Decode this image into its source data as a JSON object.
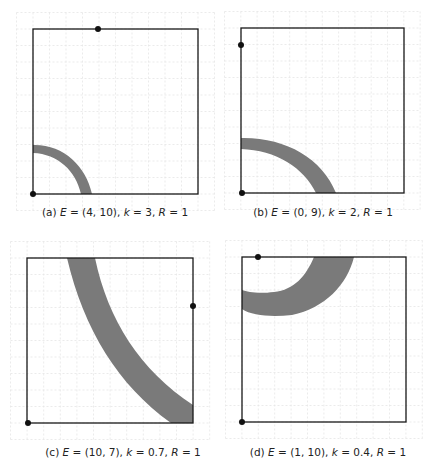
{
  "figure": {
    "colors": {
      "band": "#7a7a7a",
      "frame": "#1a1a1a",
      "grid": "#e6e6e6",
      "dot": "#111111"
    },
    "grid_unit_px": 16.5,
    "panels": [
      {
        "id": "a",
        "label": "(a)",
        "E": "(4, 10)",
        "k": "3",
        "R": "1",
        "caption": "(a) E = (4, 10), k = 3, R = 1",
        "frame": {
          "x": 33,
          "y": 29,
          "w": 165,
          "h": 165
        },
        "dots": [
          {
            "x": 98,
            "y": 29
          },
          {
            "x": 33,
            "y": 194
          }
        ],
        "band_path": "M33,145 C63,144 86,166 92,194 L81,194 C76,171 58,154 33,153 Z",
        "caption_pos": {
          "x": 115,
          "y": 206
        }
      },
      {
        "id": "b",
        "label": "(b)",
        "E": "(0, 9)",
        "k": "2",
        "R": "1",
        "caption": "(b) E = (0, 9), k = 2, R = 1",
        "frame": {
          "x": 241,
          "y": 28,
          "w": 163,
          "h": 165
        },
        "dots": [
          {
            "x": 241,
            "y": 45
          },
          {
            "x": 242,
            "y": 193
          }
        ],
        "band_path": "M241,138 C285,137 322,158 336,193 L316,193 C304,168 276,150 241,149 Z",
        "caption_pos": {
          "x": 323,
          "y": 206
        }
      },
      {
        "id": "c",
        "label": "(c)",
        "E": "(10, 7)",
        "k": "0.7",
        "R": "1",
        "caption": "(c) E = (10, 7), k = 0.7, R = 1",
        "frame": {
          "x": 27,
          "y": 258,
          "w": 166,
          "h": 165
        },
        "dots": [
          {
            "x": 193,
            "y": 306
          },
          {
            "x": 28,
            "y": 423
          }
        ],
        "band_path": "M67,258 L95,258 C108,320 140,370 193,405 L193,423 L171,423 C118,385 84,330 67,258 Z",
        "caption_pos": {
          "x": 123,
          "y": 446
        }
      },
      {
        "id": "d",
        "label": "(d)",
        "E": "(1, 10)",
        "k": "0.4",
        "R": "1",
        "caption": "(d) E = (1, 10), k = 0.4, R = 1",
        "frame": {
          "x": 242,
          "y": 257,
          "w": 164,
          "h": 165
        },
        "dots": [
          {
            "x": 258,
            "y": 257
          },
          {
            "x": 242,
            "y": 422
          }
        ],
        "band_path": "M242,309 C252,316 272,317 292,315 C325,308 347,285 354,257 L314,257 C306,276 294,290 274,292 C258,294 248,292 242,290 Z",
        "caption_pos": {
          "x": 328,
          "y": 446
        }
      }
    ]
  }
}
